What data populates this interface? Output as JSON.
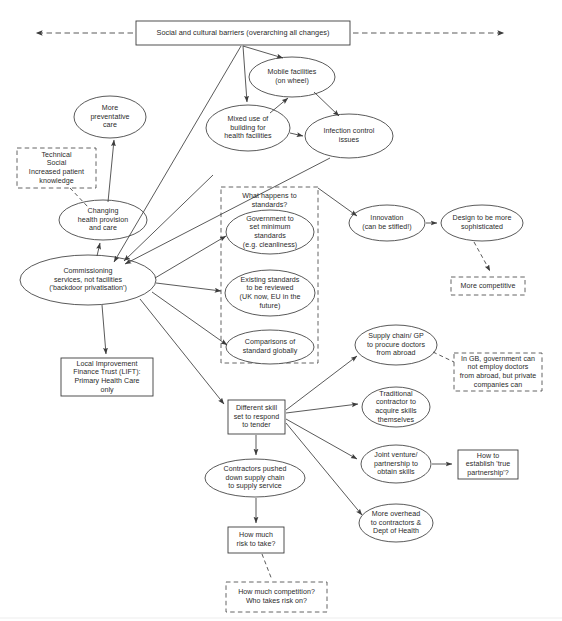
{
  "diagram": {
    "title_node": {
      "id": "social-cultural-barriers",
      "label": "Social and cultural barriers (overarching all changes)"
    },
    "colors": {
      "stroke": "#3c3c3c",
      "text": "#2a2a2a",
      "background": "#ffffff"
    },
    "nodes": [
      {
        "id": "social-cultural-barriers",
        "shape": "rect",
        "label": "Social and cultural barriers (overarching all changes)"
      },
      {
        "id": "mobile-facilities",
        "shape": "ellipse",
        "label": "Mobile facilities\n(on wheel)"
      },
      {
        "id": "mixed-use-building",
        "shape": "ellipse",
        "label": "Mixed use of\nbuilding for\nhealth facilities"
      },
      {
        "id": "infection-control",
        "shape": "ellipse",
        "label": "Infection control\nissues"
      },
      {
        "id": "more-preventative-care",
        "shape": "ellipse",
        "label": "More\npreventative\ncare"
      },
      {
        "id": "technical-social",
        "shape": "dashed-rect",
        "label": "Technical\nSocial\nIncreased patient\nknowledge"
      },
      {
        "id": "changing-health-provision",
        "shape": "ellipse",
        "label": "Changing\nhealth provision\nand care"
      },
      {
        "id": "commissioning-services",
        "shape": "ellipse",
        "label": "Commissioning\nservices, not facilities\n('backdoor privatisation')"
      },
      {
        "id": "lift",
        "shape": "rect",
        "label": "Local Improvement\nFinance Trust (LIFT):\nPrimary Health Care\nonly"
      },
      {
        "id": "standards-group",
        "shape": "dashed-group",
        "label": "What happens to\nstandards?"
      },
      {
        "id": "government-minimum-standards",
        "shape": "ellipse",
        "label": "Government to\nset minimum\nstandards\n(e.g. cleanliness)"
      },
      {
        "id": "existing-standards-reviewed",
        "shape": "ellipse",
        "label": "Existing standards\nto be reviewed\n(UK now, EU in the\nfuture)"
      },
      {
        "id": "comparisons-standard-globally",
        "shape": "ellipse",
        "label": "Comparisons of\nstandard globally"
      },
      {
        "id": "innovation",
        "shape": "ellipse",
        "label": "Innovation\n(can be stifled!)"
      },
      {
        "id": "design-sophisticated",
        "shape": "ellipse",
        "label": "Design to be more\nsophisticated"
      },
      {
        "id": "more-competitive",
        "shape": "dashed-rect",
        "label": "More competitive"
      },
      {
        "id": "supply-chain-gp",
        "shape": "ellipse",
        "label": "Supply chain/ GP\nto procure doctors\nfrom abroad"
      },
      {
        "id": "gb-government-note",
        "shape": "dashed-rect",
        "label": "In GB, government can\nnot employ doctors\nfrom abroad, but private\ncompanies can"
      },
      {
        "id": "traditional-contractor",
        "shape": "ellipse",
        "label": "Traditional\ncontractor to\nacquire skills\nthemselves"
      },
      {
        "id": "different-skill-set",
        "shape": "rect",
        "label": "Different skill\nset to respond\nto tender"
      },
      {
        "id": "joint-venture",
        "shape": "ellipse",
        "label": "Joint venture/\npartnership to\nobtain skills"
      },
      {
        "id": "establish-true-partnership",
        "shape": "rect",
        "label": "How to\nestablish 'true\npartnership'?"
      },
      {
        "id": "more-overhead",
        "shape": "ellipse",
        "label": "More overhead\nto contractors &\nDept of Health"
      },
      {
        "id": "contractors-pushed-down",
        "shape": "ellipse",
        "label": "Contractors pushed\ndown supply chain\nto supply service"
      },
      {
        "id": "how-much-risk",
        "shape": "rect",
        "label": "How much\nrisk to take?"
      },
      {
        "id": "how-much-competition",
        "shape": "dashed-rect",
        "label": "How much competition?\nWho takes risk on?"
      }
    ],
    "edges": [
      {
        "from": "social-cultural-barriers",
        "to": "left-margin",
        "style": "dashed",
        "arrow": "both"
      },
      {
        "from": "social-cultural-barriers",
        "to": "right-margin",
        "style": "dashed",
        "arrow": "both"
      },
      {
        "from": "social-cultural-barriers",
        "to": "mobile-facilities",
        "style": "solid",
        "arrow": "end"
      },
      {
        "from": "social-cultural-barriers",
        "to": "mixed-use-building",
        "style": "solid",
        "arrow": "end"
      },
      {
        "from": "social-cultural-barriers",
        "to": "commissioning-services",
        "style": "solid",
        "arrow": "end"
      },
      {
        "from": "mobile-facilities",
        "to": "infection-control",
        "style": "solid",
        "arrow": "end"
      },
      {
        "from": "mixed-use-building",
        "to": "mobile-facilities",
        "style": "solid",
        "arrow": "end"
      },
      {
        "from": "mixed-use-building",
        "to": "infection-control",
        "style": "solid",
        "arrow": "end"
      },
      {
        "from": "commissioning-services",
        "to": "mixed-use-building",
        "style": "solid",
        "arrow": "end"
      },
      {
        "from": "commissioning-services",
        "to": "infection-control",
        "style": "solid",
        "arrow": "end"
      },
      {
        "from": "changing-health-provision",
        "to": "more-preventative-care",
        "style": "solid",
        "arrow": "end"
      },
      {
        "from": "technical-social",
        "to": "changing-health-provision",
        "style": "dashed",
        "arrow": "none"
      },
      {
        "from": "commissioning-services",
        "to": "changing-health-provision",
        "style": "solid",
        "arrow": "end"
      },
      {
        "from": "commissioning-services",
        "to": "lift",
        "style": "solid",
        "arrow": "end"
      },
      {
        "from": "commissioning-services",
        "to": "government-minimum-standards",
        "style": "solid",
        "arrow": "end"
      },
      {
        "from": "commissioning-services",
        "to": "existing-standards-reviewed",
        "style": "solid",
        "arrow": "end"
      },
      {
        "from": "commissioning-services",
        "to": "comparisons-standard-globally",
        "style": "solid",
        "arrow": "end"
      },
      {
        "from": "commissioning-services",
        "to": "different-skill-set",
        "style": "solid",
        "arrow": "end"
      },
      {
        "from": "standards-group",
        "to": "innovation",
        "style": "solid",
        "arrow": "end"
      },
      {
        "from": "innovation",
        "to": "design-sophisticated",
        "style": "solid",
        "arrow": "end"
      },
      {
        "from": "design-sophisticated",
        "to": "more-competitive",
        "style": "dashed",
        "arrow": "end"
      },
      {
        "from": "different-skill-set",
        "to": "supply-chain-gp",
        "style": "solid",
        "arrow": "end"
      },
      {
        "from": "supply-chain-gp",
        "to": "gb-government-note",
        "style": "dashed",
        "arrow": "none"
      },
      {
        "from": "different-skill-set",
        "to": "traditional-contractor",
        "style": "solid",
        "arrow": "end"
      },
      {
        "from": "different-skill-set",
        "to": "joint-venture",
        "style": "solid",
        "arrow": "end"
      },
      {
        "from": "joint-venture",
        "to": "establish-true-partnership",
        "style": "solid",
        "arrow": "end"
      },
      {
        "from": "different-skill-set",
        "to": "more-overhead",
        "style": "solid",
        "arrow": "end"
      },
      {
        "from": "different-skill-set",
        "to": "contractors-pushed-down",
        "style": "solid",
        "arrow": "end"
      },
      {
        "from": "contractors-pushed-down",
        "to": "how-much-risk",
        "style": "solid",
        "arrow": "end"
      },
      {
        "from": "how-much-risk",
        "to": "how-much-competition",
        "style": "dashed",
        "arrow": "none"
      }
    ],
    "labels": {
      "social_cultural_barriers": "Social and cultural barriers (overarching all changes)",
      "mobile_facilities": "Mobile facilities\n(on wheel)",
      "mixed_use_building": "Mixed use of\nbuilding for\nhealth facilities",
      "infection_control": "Infection control\nissues",
      "more_preventative_care": "More\npreventative\ncare",
      "technical_social": "Technical\nSocial\nIncreased patient\nknowledge",
      "changing_health_provision": "Changing\nhealth provision\nand care",
      "commissioning_services": "Commissioning\nservices, not facilities\n('backdoor privatisation')",
      "lift": "Local Improvement\nFinance Trust (LIFT):\nPrimary Health Care\nonly",
      "standards_group_header": "What happens to\nstandards?",
      "government_minimum_standards": "Government to\nset minimum\nstandards\n(e.g. cleanliness)",
      "existing_standards_reviewed": "Existing standards\nto be reviewed\n(UK now, EU in the\nfuture)",
      "comparisons_standard_globally": "Comparisons of\nstandard globally",
      "innovation": "Innovation\n(can be stifled!)",
      "design_sophisticated": "Design to be more\nsophisticated",
      "more_competitive": "More competitive",
      "supply_chain_gp": "Supply chain/ GP\nto procure doctors\nfrom abroad",
      "gb_government_note": "In GB, government can\nnot employ doctors\nfrom abroad, but private\ncompanies can",
      "traditional_contractor": "Traditional\ncontractor to\nacquire skills\nthemselves",
      "different_skill_set": "Different skill\nset to respond\nto tender",
      "joint_venture": "Joint venture/\npartnership to\nobtain skills",
      "establish_true_partnership": "How to\nestablish 'true\npartnership'?",
      "more_overhead": "More overhead\nto contractors &\nDept of Health",
      "contractors_pushed_down": "Contractors pushed\ndown supply chain\nto supply service",
      "how_much_risk": "How much\nrisk to take?",
      "how_much_competition": "How much competition?\nWho takes risk on?"
    }
  }
}
